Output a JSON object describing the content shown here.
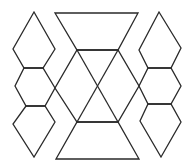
{
  "figure": {
    "stroke_color": "#2a2a2a",
    "background": "#ffffff"
  },
  "shapes": {
    "top_trapezoid": "55,13 138,13 118,50 77,50",
    "bottom_trapezoid": "77,122 118,122 139,159 56,159",
    "center_hexagon": "77,50 118,50 139,86 118,122 77,122 55,88",
    "diagonal_a": "77,50 118,122",
    "diagonal_b": "118,50 77,122",
    "left_top_diamond": "34,12 55,49 43,68 24,68 13,49",
    "left_middle_hexagon": "24,68 43,68 55,88 45,106 26,106 15,86",
    "left_bottom_diamond": "26,106 45,106 55,122 34,157 13,124",
    "right_top_diamond": "159,12 181,48 171,68 148,68 139,50",
    "right_middle_hexagon": "148,68 171,68 181,86 171,104 148,104 139,86",
    "right_bottom_diamond": "148,104 171,104 181,122 161,157 140,121"
  }
}
